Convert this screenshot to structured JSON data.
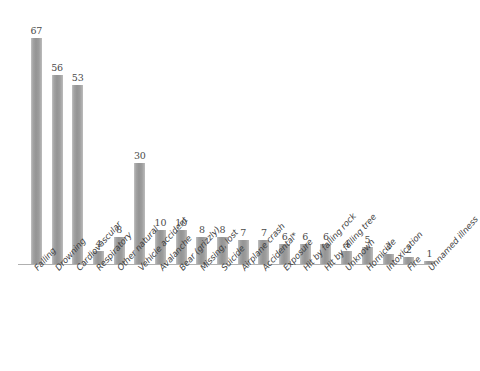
{
  "chart_data": {
    "type": "bar",
    "title": "",
    "subtitle": "",
    "xlabel": "",
    "ylabel": "",
    "ylim": [
      0,
      70
    ],
    "grid": false,
    "legend": false,
    "orientation": "vertical",
    "bar_color": "#9a9a9a",
    "axis_color": "#b0b0b0",
    "label_color": "#3f3f3f",
    "background": "#ffffff",
    "value_labels_shown": true,
    "categories": [
      "Falling",
      "Drowning",
      "Cardiovascular",
      "Respiratory",
      "Other natural",
      "Vehicle accident",
      "Avalanche",
      "Bear (grizzly)",
      "Missing, lost",
      "Suicide",
      "Airplane crash",
      "Accidental*",
      "Exposure",
      "Hit by falling rock",
      "Hit by falling tree",
      "Unknown",
      "Homicide",
      "Intoxication",
      "Fire",
      "Unnamed illness"
    ],
    "values": [
      67,
      56,
      53,
      4,
      8,
      30,
      10,
      10,
      8,
      8,
      7,
      7,
      6,
      6,
      6,
      4,
      5,
      3,
      2,
      1
    ],
    "annotations": [
      "*"
    ]
  }
}
